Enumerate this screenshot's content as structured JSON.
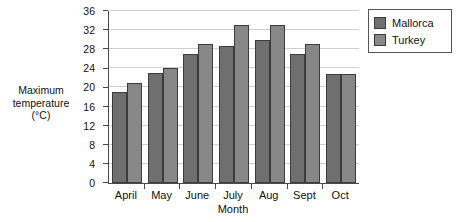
{
  "chart_data": {
    "type": "bar",
    "title": "",
    "subtitle": "",
    "xlabel": "Month",
    "ylabel": "Maximum temperature (°C)",
    "ylabel_lines": [
      "Maximum",
      "temperature",
      "(°C)"
    ],
    "categories": [
      "April",
      "May",
      "June",
      "July",
      "Aug",
      "Sept",
      "Oct"
    ],
    "series": [
      {
        "name": "Mallorca",
        "color": "#6f6f6f",
        "values": [
          19,
          23,
          27,
          28.7,
          30,
          27,
          22.8
        ]
      },
      {
        "name": "Turkey",
        "color": "#878787",
        "values": [
          21,
          24,
          29,
          33,
          33,
          29,
          22.8
        ]
      }
    ],
    "ylim": [
      0,
      36
    ],
    "yticks": [
      0,
      4,
      8,
      12,
      16,
      20,
      24,
      28,
      32,
      36
    ],
    "ytick_labels": [
      "0",
      "4",
      "8",
      "12",
      "16",
      "20",
      "24",
      "28",
      "32",
      "36"
    ],
    "grid": true,
    "grid_axis": "y",
    "legend_position": "right-top",
    "legend_entries": [
      "Mallorca",
      "Turkey"
    ]
  }
}
